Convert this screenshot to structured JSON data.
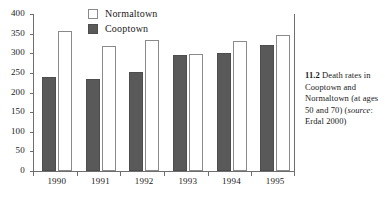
{
  "chart_data": {
    "type": "bar",
    "title": "",
    "xlabel": "",
    "ylabel": "",
    "categories": [
      "1990",
      "1991",
      "1992",
      "1993",
      "1994",
      "1995"
    ],
    "series": [
      {
        "name": "Cooptown",
        "color": "#595959",
        "values": [
          240,
          235,
          252,
          295,
          301,
          322
        ]
      },
      {
        "name": "Normaltown",
        "color": "#ffffff",
        "values": [
          357,
          319,
          335,
          298,
          332,
          346
        ]
      }
    ],
    "ylim": [
      0,
      400
    ],
    "yticks": [
      0,
      50,
      100,
      150,
      200,
      250,
      300,
      350,
      400
    ],
    "ytick_labels": [
      "0",
      "50",
      "100",
      "150",
      "200",
      "250",
      "300",
      "350",
      "400"
    ],
    "grid": false,
    "legend_position": "top-center",
    "legend_entries": [
      {
        "label": "Normaltown",
        "swatch": "open"
      },
      {
        "label": "Cooptown",
        "swatch": "filled"
      }
    ]
  },
  "legend": {
    "normaltown_label": "Normaltown",
    "cooptown_label": "Cooptown"
  },
  "caption": {
    "figure_number": "11.2",
    "text_before_source": " Death rates in Cooptown and Normaltown (at ages 50 and 70) (",
    "source_label": "source",
    "text_after_source": ": Erdal 2000)"
  }
}
